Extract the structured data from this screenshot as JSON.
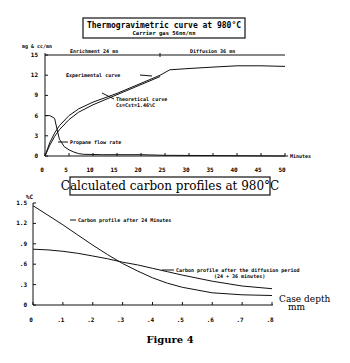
{
  "figure_caption": "Figure 4",
  "chart_data": [
    {
      "type": "line",
      "title": "Thermogravimetric curve at 980°C",
      "subtitle": "Carrier gas 56nn/nn",
      "xlabel": "Minutes",
      "ylabel": "mg & cc/mn",
      "xlim": [
        0,
        50
      ],
      "ylim": [
        0,
        15
      ],
      "x_ticks": [
        "0",
        "5",
        "10",
        "15",
        "20",
        "25",
        "30",
        "35",
        "40",
        "45",
        "50"
      ],
      "y_ticks": [
        "0",
        "3",
        "6",
        "9",
        "12",
        "15"
      ],
      "annotations": {
        "enrichment": "Enrichment 24 mn",
        "diffusion": "Diffusion 36 mn",
        "experimental": "Experimental curve",
        "theoretical_line1": "Theoretical curve",
        "theoretical_line2": "Cs=Cst=1.46%C",
        "propane": "Propane flow rate"
      },
      "series": [
        {
          "name": "Experimental curve",
          "x": [
            0,
            1,
            2,
            3,
            5,
            7,
            10,
            15,
            20,
            24,
            26,
            30,
            35,
            40,
            45,
            50
          ],
          "y": [
            0,
            2.0,
            3.4,
            4.5,
            6.0,
            7.0,
            8.0,
            9.3,
            10.8,
            12.0,
            12.8,
            13.0,
            13.2,
            13.4,
            13.4,
            13.3
          ]
        },
        {
          "name": "Theoretical curve Cs=Cst=1.46%C",
          "x": [
            0,
            1,
            2,
            3,
            5,
            7,
            10,
            15,
            20,
            24
          ],
          "y": [
            0,
            1.6,
            2.9,
            3.9,
            5.4,
            6.5,
            7.6,
            9.1,
            10.6,
            11.8
          ]
        },
        {
          "name": "Propane flow rate",
          "x": [
            0,
            1,
            2,
            2.5,
            3,
            4,
            5,
            6,
            7,
            8,
            12,
            20,
            25,
            50
          ],
          "y": [
            6.0,
            6.0,
            5.6,
            4.0,
            2.5,
            1.4,
            0.9,
            0.6,
            0.35,
            0.25,
            0.2,
            0.2,
            0.1,
            0.0
          ]
        }
      ]
    },
    {
      "type": "line",
      "title": "Calculated carbon profiles at 980°C",
      "xlabel": "Case depth mm",
      "xlabel_line1": "Case depth",
      "xlabel_line2": "mm",
      "ylabel": "%C",
      "xlim": [
        0,
        0.8
      ],
      "ylim": [
        0,
        1.5
      ],
      "x_ticks": [
        "0",
        ".1",
        ".2",
        ".3",
        ".4",
        ".5",
        ".6",
        ".7",
        ".8"
      ],
      "y_ticks": [
        "0",
        ".3",
        ".6",
        ".9",
        "1.2",
        "1.5"
      ],
      "annotations": {
        "after24": "Carbon profile after 24 Minutes",
        "after_diffusion_line1": "Carbon profile after the diffusion period",
        "after_diffusion_line2": "(24 + 36 minutes)"
      },
      "series": [
        {
          "name": "Carbon profile after 24 Minutes",
          "x": [
            0,
            0.05,
            0.1,
            0.15,
            0.2,
            0.25,
            0.3,
            0.35,
            0.4,
            0.45,
            0.5,
            0.6,
            0.7,
            0.8
          ],
          "y": [
            1.46,
            1.32,
            1.18,
            1.03,
            0.88,
            0.74,
            0.61,
            0.5,
            0.4,
            0.32,
            0.26,
            0.18,
            0.15,
            0.14
          ]
        },
        {
          "name": "Carbon profile after the diffusion period (24 + 36 minutes)",
          "x": [
            0,
            0.05,
            0.1,
            0.15,
            0.2,
            0.25,
            0.3,
            0.35,
            0.4,
            0.45,
            0.5,
            0.6,
            0.7,
            0.8
          ],
          "y": [
            0.82,
            0.81,
            0.79,
            0.76,
            0.72,
            0.68,
            0.63,
            0.59,
            0.54,
            0.49,
            0.44,
            0.35,
            0.28,
            0.24
          ]
        }
      ]
    }
  ]
}
